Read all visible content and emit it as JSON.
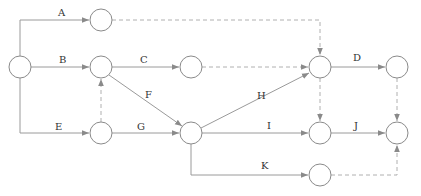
{
  "diagram": {
    "type": "activity-on-arrow network",
    "nodes": [
      {
        "id": 1,
        "x": 20,
        "y": 67
      },
      {
        "id": 2,
        "x": 101,
        "y": 20
      },
      {
        "id": 3,
        "x": 101,
        "y": 67
      },
      {
        "id": 4,
        "x": 191,
        "y": 67
      },
      {
        "id": 5,
        "x": 101,
        "y": 133
      },
      {
        "id": 6,
        "x": 191,
        "y": 133
      },
      {
        "id": 7,
        "x": 320,
        "y": 67
      },
      {
        "id": 8,
        "x": 397,
        "y": 67
      },
      {
        "id": 9,
        "x": 320,
        "y": 133
      },
      {
        "id": 10,
        "x": 397,
        "y": 133
      },
      {
        "id": 11,
        "x": 320,
        "y": 175
      }
    ],
    "activities": [
      {
        "label": "A",
        "from": 1,
        "to": 2
      },
      {
        "label": "B",
        "from": 1,
        "to": 3
      },
      {
        "label": "C",
        "from": 3,
        "to": 4
      },
      {
        "label": "D",
        "from": 7,
        "to": 8
      },
      {
        "label": "E",
        "from": 1,
        "to": 5
      },
      {
        "label": "F",
        "from": 3,
        "to": 6
      },
      {
        "label": "G",
        "from": 5,
        "to": 6
      },
      {
        "label": "H",
        "from": 6,
        "to": 7
      },
      {
        "label": "I",
        "from": 6,
        "to": 9
      },
      {
        "label": "J",
        "from": 9,
        "to": 10
      },
      {
        "label": "K",
        "from": 6,
        "to": 11
      }
    ],
    "dummies": [
      {
        "from": 2,
        "to": 7
      },
      {
        "from": 4,
        "to": 7
      },
      {
        "from": 5,
        "to": 3
      },
      {
        "from": 7,
        "to": 9
      },
      {
        "from": 8,
        "to": 10
      },
      {
        "from": 11,
        "to": 10
      }
    ],
    "labels": {
      "A": "A",
      "B": "B",
      "C": "C",
      "D": "D",
      "E": "E",
      "F": "F",
      "G": "G",
      "H": "H",
      "I": "I",
      "J": "J",
      "K": "K"
    }
  }
}
